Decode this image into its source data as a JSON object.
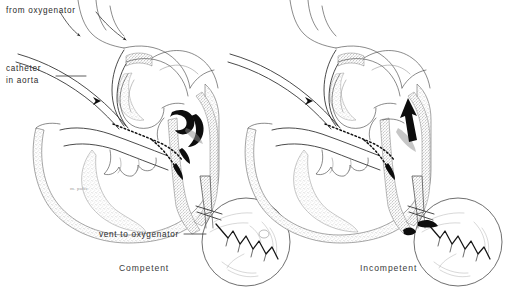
{
  "figure": {
    "background_color": "#ffffff",
    "ink_color": "#2a2a2a",
    "width": 517,
    "height": 297
  },
  "labels": {
    "from_oxygenator": "from oxygenator",
    "catheter_in_aorta_line1": "catheter",
    "catheter_in_aorta_line2": "in aorta",
    "vent_to_oxygenator": "vent to oxygenator",
    "signature": "m. pulis"
  },
  "panels": [
    {
      "id": "left",
      "caption": "Competent",
      "valve_state": "closed",
      "inset": {
        "shape": "circle",
        "content": "closed aortic valve leaflets forming zigzag coaptation line",
        "has_regurgitant_jet": false
      },
      "arrows": [
        {
          "name": "oxygenator-inflow-arrow-1",
          "direction": "into-arch-vessel"
        },
        {
          "name": "oxygenator-inflow-arrow-2",
          "direction": "into-arch"
        },
        {
          "name": "catheter-tip-arrow",
          "direction": "down-aorta"
        }
      ],
      "annotations": [
        "from oxygenator",
        "catheter in aorta",
        "vent to oxygenator"
      ]
    },
    {
      "id": "right",
      "caption": "Incompetent",
      "valve_state": "open-regurgitant",
      "inset": {
        "shape": "circle",
        "content": "incompetent aortic valve leaflets with regurgitant gap",
        "has_regurgitant_jet": true
      },
      "arrows": [
        {
          "name": "catheter-tip-arrow",
          "direction": "down-aorta"
        },
        {
          "name": "regurgitation-arrow",
          "direction": "retrograde-into-left-ventricle"
        }
      ],
      "annotations": []
    }
  ]
}
